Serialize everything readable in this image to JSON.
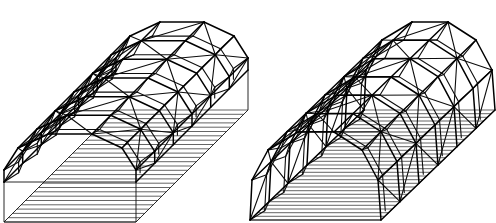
{
  "figure": {
    "background": "#ffffff",
    "line_color": "#000000"
  },
  "frames": [
    {
      "name": "left-frame-polygonal-with-walls",
      "front_base_left": [
        4,
        182
      ],
      "front_base_right": [
        136,
        182
      ],
      "depth_offset": [
        112,
        -112
      ],
      "bays": 6,
      "arch_profile": [
        [
          0,
          0
        ],
        [
          0,
          -12
        ],
        [
          14,
          -34
        ],
        [
          44,
          -48
        ],
        [
          88,
          -48
        ],
        [
          118,
          -34
        ],
        [
          132,
          -12
        ],
        [
          132,
          0
        ]
      ],
      "wall_height": 36,
      "hatch_count": 26,
      "has_walls": true
    },
    {
      "name": "right-frame-arched-barrel-vault",
      "front_base_left": [
        250,
        220
      ],
      "front_base_right": [
        381,
        220
      ],
      "depth_offset": [
        114,
        -110
      ],
      "bays": 6,
      "arch_profile": [
        [
          0,
          0
        ],
        [
          2,
          -40
        ],
        [
          18,
          -70
        ],
        [
          48,
          -88
        ],
        [
          84,
          -88
        ],
        [
          112,
          -70
        ],
        [
          128,
          -40
        ],
        [
          131,
          0
        ]
      ],
      "wall_height": 0,
      "hatch_count": 30,
      "has_walls": false
    }
  ]
}
